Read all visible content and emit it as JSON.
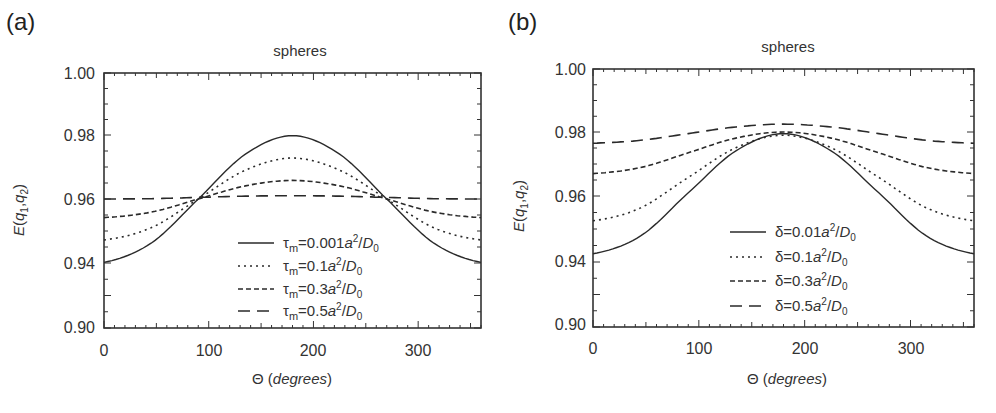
{
  "chart_data": [
    {
      "panel": "(a)",
      "type": "line",
      "title": "spheres",
      "xlabel": "Θ (degrees)",
      "ylabel": "E(q1,q2)",
      "xlim": [
        0,
        360
      ],
      "ylim": [
        0.9,
        1.0
      ],
      "xticks": [
        "0",
        "100",
        "200",
        "300"
      ],
      "yticks": [
        "0.90",
        "0.94",
        "0.96",
        "0.98",
        "1.00"
      ],
      "grid": false,
      "legend_position": "lower center",
      "x": [
        0,
        45,
        90,
        135,
        180,
        225,
        270,
        315,
        360
      ],
      "series": [
        {
          "name": "τm=0.001a²/D0",
          "style": "solid",
          "values": [
            0.9402,
            0.9462,
            0.96,
            0.974,
            0.9798,
            0.974,
            0.96,
            0.9462,
            0.9402
          ]
        },
        {
          "name": "τm=0.1a²/D0",
          "style": "dotted",
          "values": [
            0.9472,
            0.951,
            0.96,
            0.969,
            0.9728,
            0.969,
            0.96,
            0.951,
            0.9472
          ]
        },
        {
          "name": "τm=0.3a²/D0",
          "style": "short-dash",
          "values": [
            0.9542,
            0.9559,
            0.96,
            0.9641,
            0.9658,
            0.9641,
            0.96,
            0.9559,
            0.9542
          ]
        },
        {
          "name": "τm=0.5a²/D0",
          "style": "long-dash",
          "values": [
            0.96,
            0.9601,
            0.9605,
            0.9609,
            0.961,
            0.9609,
            0.9605,
            0.9601,
            0.96
          ]
        }
      ]
    },
    {
      "panel": "(b)",
      "type": "line",
      "title": "spheres",
      "xlabel": "Θ (degrees)",
      "ylabel": "E(q1,q2)",
      "xlim": [
        0,
        360
      ],
      "ylim": [
        0.9,
        1.0
      ],
      "xticks": [
        "0",
        "100",
        "200",
        "300"
      ],
      "yticks": [
        "0.90",
        "0.94",
        "0.96",
        "0.98",
        "1.00"
      ],
      "grid": false,
      "legend_position": "lower center",
      "x": [
        0,
        45,
        90,
        135,
        180,
        225,
        270,
        315,
        360
      ],
      "series": [
        {
          "name": "δ=0.01a²/D0",
          "style": "solid",
          "values": [
            0.9425,
            0.9479,
            0.961,
            0.9741,
            0.9795,
            0.9741,
            0.961,
            0.9479,
            0.9425
          ]
        },
        {
          "name": "δ=0.1a²/D0",
          "style": "dotted",
          "values": [
            0.9525,
            0.9564,
            0.9658,
            0.9751,
            0.979,
            0.9751,
            0.9658,
            0.9564,
            0.9525
          ]
        },
        {
          "name": "δ=0.3a²/D0",
          "style": "short-dash",
          "values": [
            0.967,
            0.9689,
            0.9735,
            0.9781,
            0.98,
            0.9781,
            0.9735,
            0.9689,
            0.967
          ]
        },
        {
          "name": "δ=0.5a²/D0",
          "style": "long-dash",
          "values": [
            0.9765,
            0.9774,
            0.9795,
            0.9816,
            0.9825,
            0.9816,
            0.9795,
            0.9774,
            0.9765
          ]
        }
      ]
    }
  ],
  "panels": [
    {
      "label": "(a)",
      "title": "spheres",
      "ylabel": "E(q1,q2)",
      "xlabel_prefix": "Θ (",
      "xlabel_italic": "degrees",
      "xlabel_suffix": ")",
      "xticks": [
        "0",
        "100",
        "200",
        "300"
      ],
      "yticks": [
        "1.00",
        "0.98",
        "0.96",
        "0.94",
        "0.90"
      ],
      "legend": [
        {
          "sym": "τ",
          "sub": "m",
          "eq": "=0.001",
          "a": "a",
          "sup": "2",
          "rest": "/D",
          "sub2": "0"
        },
        {
          "sym": "τ",
          "sub": "m",
          "eq": "=0.1",
          "a": "a",
          "sup": "2",
          "rest": "/D",
          "sub2": "0"
        },
        {
          "sym": "τ",
          "sub": "m",
          "eq": "=0.3",
          "a": "a",
          "sup": "2",
          "rest": "/D",
          "sub2": "0"
        },
        {
          "sym": "τ",
          "sub": "m",
          "eq": "=0.5",
          "a": "a",
          "sup": "2",
          "rest": "/D",
          "sub2": "0"
        }
      ]
    },
    {
      "label": "(b)",
      "title": "spheres",
      "ylabel": "E(q1,q2)",
      "xlabel_prefix": "Θ (",
      "xlabel_italic": "degrees",
      "xlabel_suffix": ")",
      "xticks": [
        "0",
        "100",
        "200",
        "300"
      ],
      "yticks": [
        "1.00",
        "0.98",
        "0.96",
        "0.94",
        "0.90"
      ],
      "legend": [
        {
          "sym": "δ",
          "sub": "",
          "eq": "=0.01",
          "a": "a",
          "sup": "2",
          "rest": "/D",
          "sub2": "0"
        },
        {
          "sym": "δ",
          "sub": "",
          "eq": "=0.1",
          "a": "a",
          "sup": "2",
          "rest": "/D",
          "sub2": "0"
        },
        {
          "sym": "δ",
          "sub": "",
          "eq": "=0.3",
          "a": "a",
          "sup": "2",
          "rest": "/D",
          "sub2": "0"
        },
        {
          "sym": "δ",
          "sub": "",
          "eq": "=0.5",
          "a": "a",
          "sup": "2",
          "rest": "/D",
          "sub2": "0"
        }
      ]
    }
  ],
  "colors": {
    "line": "#2a2a2a",
    "axis": "#333333",
    "text": "#333333"
  }
}
